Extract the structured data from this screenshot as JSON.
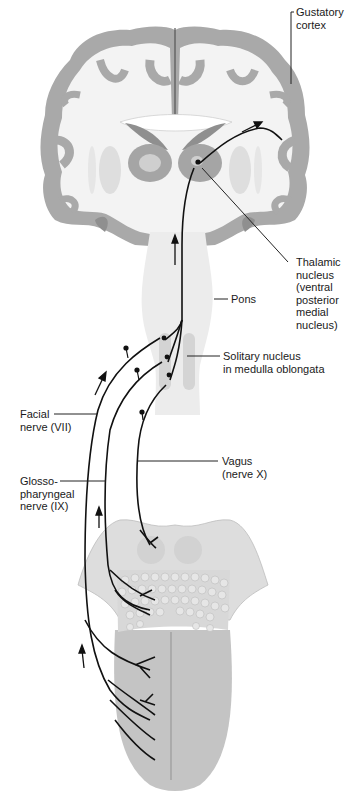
{
  "figure": {
    "colors": {
      "cortex_gray": "#a9a9a9",
      "white_matter": "#f4f4f4",
      "deep_nuclei": "#c9c9c9",
      "brainstem": "#ededed",
      "tongue": "#c4c4c4",
      "papillae": "#d6d6d6",
      "nerve_line": "#111111",
      "leader_line": "#222222",
      "text": "#1a1a1a"
    }
  },
  "labels": {
    "gustatory_cortex": "Gustatory\ncortex",
    "thalamic_nucleus": "Thalamic\nnucleus\n(ventral\nposterior\nmedial\nnucleus)",
    "pons": "Pons",
    "solitary_nucleus": "Solitary nucleus\nin medulla oblongata",
    "facial_nerve": "Facial\nnerve (VII)",
    "glossopharyngeal_nerve": "Glosso-\npharyngeal\nnerve (IX)",
    "vagus_nerve": "Vagus\n(nerve X)"
  }
}
